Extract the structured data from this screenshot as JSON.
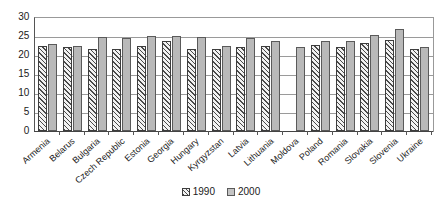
{
  "chart_data": {
    "type": "bar",
    "title": "",
    "subtitle": "",
    "xlabel": "",
    "ylabel": "",
    "ylim": [
      0,
      30
    ],
    "ytick_step": 5,
    "yticks": [
      30,
      25,
      20,
      15,
      10,
      5,
      0
    ],
    "grid": true,
    "grid_axis": "y",
    "legend_position": "bottom-center",
    "categories": [
      "Armenia",
      "Belarus",
      "Bulgaria",
      "Czech Republic",
      "Estonia",
      "Georgia",
      "Hungary",
      "Kyrgyzstan",
      "Latvia",
      "Lithuania",
      "Moldova",
      "Poland",
      "Romania",
      "Slovakia",
      "Slovenia",
      "Ukraine"
    ],
    "series": [
      {
        "name": "1990",
        "style": "hatched",
        "color": "#f2f2f2",
        "values": [
          22.3,
          22.0,
          21.6,
          21.6,
          22.5,
          23.6,
          21.5,
          21.6,
          22.2,
          22.3,
          null,
          22.6,
          22.0,
          23.2,
          23.9,
          21.5
        ]
      },
      {
        "name": "2000",
        "style": "solid",
        "color": "#b9b9b9",
        "values": [
          22.9,
          22.3,
          24.7,
          24.5,
          25.0,
          25.0,
          24.8,
          22.4,
          24.4,
          23.7,
          22.1,
          23.7,
          23.8,
          25.3,
          26.8,
          22.1
        ]
      }
    ]
  },
  "legend": {
    "entries": [
      {
        "label": "1990"
      },
      {
        "label": "2000"
      }
    ]
  },
  "colors": {
    "series_1990": "#f2f2f2",
    "series_2000": "#b9b9b9",
    "axis": "#444444",
    "grid": "#9a9a9a",
    "text": "#1a1a1a",
    "background": "#ffffff"
  }
}
